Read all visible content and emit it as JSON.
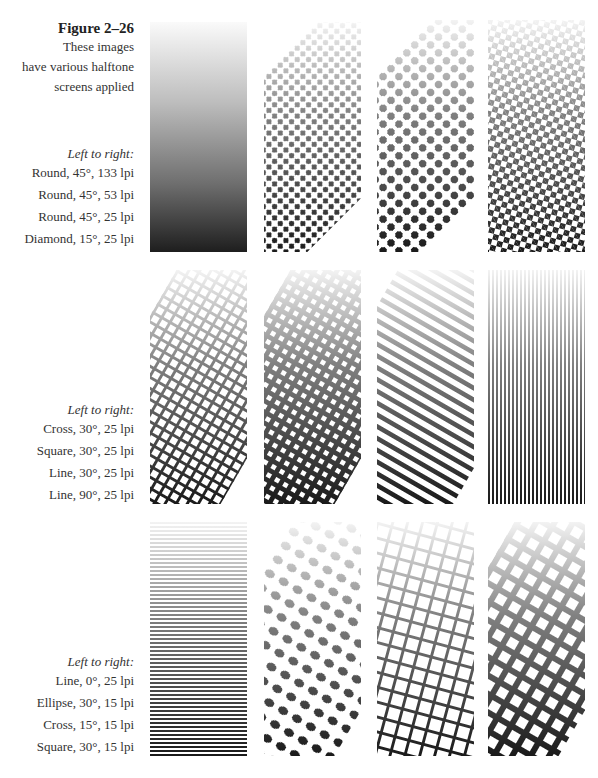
{
  "figure": {
    "title": "Figure 2–26",
    "description_lines": [
      "These images",
      "have various halftone",
      "screens applied"
    ]
  },
  "rows": [
    {
      "heading": "Left to right:",
      "specs": [
        "Round,  45°, 133 lpi",
        "Round, 45°, 53 lpi",
        "Round, 45°, 25 lpi",
        "Diamond, 15°, 25 lpi"
      ],
      "panels": [
        {
          "shape": "round",
          "angle": "45°",
          "lpi": "133"
        },
        {
          "shape": "round",
          "angle": "45°",
          "lpi": "53"
        },
        {
          "shape": "round",
          "angle": "45°",
          "lpi": "25"
        },
        {
          "shape": "diamond",
          "angle": "15°",
          "lpi": "25"
        }
      ]
    },
    {
      "heading": "Left to right:",
      "specs": [
        "Cross, 30°, 25 lpi",
        "Square, 30°, 25 lpi",
        "Line, 30°, 25 lpi",
        "Line, 90°, 25 lpi"
      ],
      "panels": [
        {
          "shape": "cross",
          "angle": "30°",
          "lpi": "25"
        },
        {
          "shape": "square",
          "angle": "30°",
          "lpi": "25"
        },
        {
          "shape": "line",
          "angle": "30°",
          "lpi": "25"
        },
        {
          "shape": "line",
          "angle": "90°",
          "lpi": "25"
        }
      ]
    },
    {
      "heading": "Left to right:",
      "specs": [
        "Line, 0°, 25 lpi",
        "Ellipse, 30°, 15 lpi",
        "Cross, 15°, 15 lpi",
        "Square, 30°, 15 lpi"
      ],
      "panels": [
        {
          "shape": "line",
          "angle": "0°",
          "lpi": "25"
        },
        {
          "shape": "ellipse",
          "angle": "30°",
          "lpi": "15"
        },
        {
          "shape": "cross",
          "angle": "15°",
          "lpi": "15"
        },
        {
          "shape": "square",
          "angle": "30°",
          "lpi": "15"
        }
      ]
    }
  ]
}
